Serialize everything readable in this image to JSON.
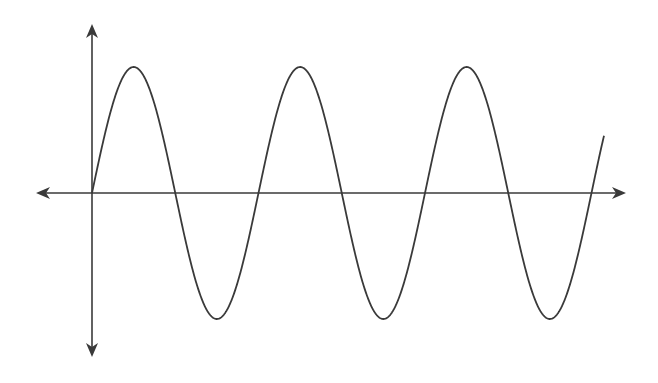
{
  "diagram": {
    "type": "sine-wave-graph",
    "background": "#ffffff",
    "stroke_color": "#3a3a3a",
    "axes": {
      "origin": {
        "x": 92,
        "y": 193
      },
      "x_axis": {
        "left_tip": 36,
        "right_tip": 626
      },
      "y_axis": {
        "top_tip": 24,
        "bottom_tip": 357
      },
      "arrowheads": "both-ends"
    },
    "curve": {
      "function": "sine",
      "amplitude_px": 126,
      "period_px": 166.5,
      "phase": "starts at origin going up",
      "x_start": 92,
      "x_end": 604,
      "peaks": 3,
      "troughs": 3
    },
    "labels": []
  }
}
